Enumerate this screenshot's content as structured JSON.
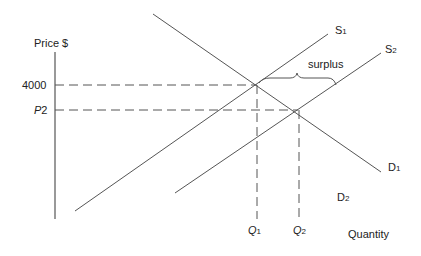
{
  "diagram": {
    "type": "supply-demand",
    "axes": {
      "y_label": "Price $",
      "x_label": "Quantity"
    },
    "price_ticks": [
      {
        "label": "4000",
        "italic": false
      },
      {
        "label": "P",
        "sub": "2",
        "italic": true
      }
    ],
    "quantity_ticks": [
      {
        "label": "Q",
        "sub": "1"
      },
      {
        "label": "Q",
        "sub": "2"
      }
    ],
    "curves": {
      "S1": {
        "label": "S",
        "sub": "1"
      },
      "S2": {
        "label": "S",
        "sub": "2"
      },
      "D1": {
        "label": "D",
        "sub": "1"
      },
      "D2": {
        "label": "D",
        "sub": "2"
      }
    },
    "annotation": "surplus",
    "colors": {
      "line": "#555555",
      "axis_accent": "#e8a0d8"
    }
  }
}
